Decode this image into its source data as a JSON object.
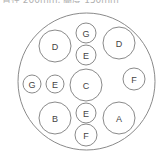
{
  "caption_fragment": "直径 200mm, 高度 150mm",
  "diagram": {
    "stroke_color": "#8a8a8a",
    "label_color": "#444444",
    "outer_circle": {
      "cx": 86.5,
      "cy": 81.5,
      "r": 68.5
    },
    "circles": [
      {
        "label": "D",
        "cx": 55,
        "cy": 46,
        "r": 16
      },
      {
        "label": "G",
        "cx": 86,
        "cy": 33,
        "r": 10
      },
      {
        "label": "E",
        "cx": 86,
        "cy": 55,
        "r": 10
      },
      {
        "label": "D",
        "cx": 119,
        "cy": 43,
        "r": 16
      },
      {
        "label": "G",
        "cx": 32,
        "cy": 84,
        "r": 9
      },
      {
        "label": "E",
        "cx": 55,
        "cy": 84,
        "r": 9
      },
      {
        "label": "C",
        "cx": 86,
        "cy": 85,
        "r": 16
      },
      {
        "label": "F",
        "cx": 134,
        "cy": 79,
        "r": 11
      },
      {
        "label": "B",
        "cx": 55,
        "cy": 118,
        "r": 16
      },
      {
        "label": "E",
        "cx": 86,
        "cy": 113,
        "r": 10
      },
      {
        "label": "A",
        "cx": 119,
        "cy": 118,
        "r": 16
      },
      {
        "label": "F",
        "cx": 86,
        "cy": 135,
        "r": 11
      }
    ]
  }
}
